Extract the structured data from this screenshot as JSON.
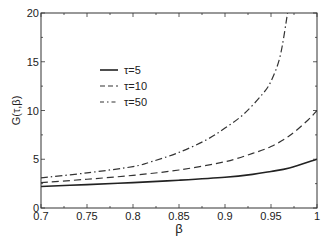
{
  "chart_data": {
    "type": "line",
    "title": "",
    "xlabel": "β",
    "ylabel": "G(τ,β)",
    "xlim": [
      0.7,
      1.0
    ],
    "ylim": [
      0,
      20
    ],
    "x_ticks": [
      0.7,
      0.75,
      0.8,
      0.85,
      0.9,
      0.95,
      1
    ],
    "x_tick_labels": [
      "0.7",
      "0.75",
      "0.8",
      "0.85",
      "0.9",
      "0.95",
      "1"
    ],
    "y_ticks": [
      0,
      5,
      10,
      15,
      20
    ],
    "y_tick_labels": [
      "0",
      "5",
      "10",
      "15",
      "20"
    ],
    "grid": false,
    "legend_position": "upper left (inside)",
    "series": [
      {
        "name": "τ=5",
        "style": "solid",
        "color": "#222222",
        "x": [
          0.7,
          0.75,
          0.8,
          0.85,
          0.9,
          0.93,
          0.95,
          0.97,
          1.0
        ],
        "y": [
          2.2,
          2.4,
          2.6,
          2.85,
          3.15,
          3.45,
          3.75,
          4.1,
          5.0
        ]
      },
      {
        "name": "τ=10",
        "style": "dashed",
        "color": "#333333",
        "x": [
          0.7,
          0.75,
          0.8,
          0.85,
          0.9,
          0.93,
          0.95,
          0.97,
          0.99,
          1.0
        ],
        "y": [
          2.6,
          2.95,
          3.35,
          3.9,
          4.75,
          5.6,
          6.3,
          7.4,
          9.0,
          10.0
        ]
      },
      {
        "name": "τ=50",
        "style": "dashdot",
        "color": "#333333",
        "x": [
          0.7,
          0.75,
          0.8,
          0.82,
          0.85,
          0.88,
          0.9,
          0.92,
          0.94,
          0.95,
          0.96,
          0.968
        ],
        "y": [
          3.1,
          3.6,
          4.25,
          4.75,
          5.7,
          7.0,
          8.2,
          9.6,
          11.6,
          13.0,
          15.6,
          20.0
        ]
      }
    ]
  }
}
